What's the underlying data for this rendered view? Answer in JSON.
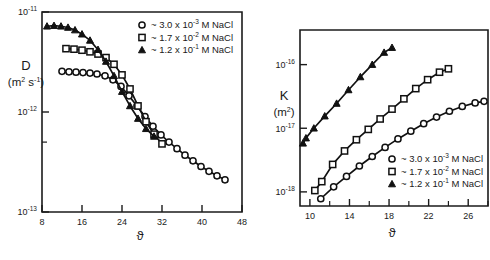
{
  "figure": {
    "panels": [
      "left-diffusion-panel",
      "right-permeability-panel"
    ]
  },
  "legend": {
    "entries": [
      {
        "marker": "open-circle",
        "label": "~ 3.0 x 10",
        "exponent": "-3",
        "unit": "M NaCl",
        "value": 3.0,
        "exp": -3
      },
      {
        "marker": "open-square",
        "label": "~ 1.7 x 10",
        "exponent": "-2",
        "unit": "M NaCl",
        "value": 1.7,
        "exp": -2
      },
      {
        "marker": "filled-triangle",
        "label": "~ 1.2 x 10",
        "exponent": "-1",
        "unit": "M NaCl",
        "value": 1.2,
        "exp": -1
      }
    ]
  },
  "chart_data": [
    {
      "id": "left-diffusion-panel",
      "type": "line",
      "title": "",
      "ylabel": "D",
      "ylabel_units": "(m2 s-1)",
      "ylabel_main": "D",
      "xlabel": "ϑ",
      "xlim": [
        8,
        48
      ],
      "ylim": [
        1e-13,
        1e-11
      ],
      "yscale": "log",
      "grid": false,
      "legend_position": "top-right",
      "xticks": [
        8,
        16,
        24,
        32,
        40,
        48
      ],
      "xticklabels": [
        "8",
        "16",
        "24",
        "32",
        "40",
        "48"
      ],
      "yticks": [
        1e-13,
        1e-12,
        1e-11
      ],
      "yticklabels": [
        "10-13",
        "10-12",
        "10-11"
      ],
      "yticklabels_base": [
        "10",
        "10",
        "10"
      ],
      "yticklabels_exp": [
        "-13",
        "-12",
        "-11"
      ],
      "yminorticks": [
        5e-13
      ],
      "series": [
        {
          "name": "~ 3.0 x 10-3 M NaCl",
          "marker": "open-circle",
          "x": [
            12.0,
            13.4,
            14.8,
            16.2,
            17.6,
            19.0,
            20.6,
            22.2,
            23.8,
            25.4,
            27.0,
            28.6,
            30.2,
            31.8,
            33.4,
            35.0,
            36.6,
            38.2,
            39.8,
            41.4,
            43.0,
            44.6
          ],
          "y": [
            2.55e-12,
            2.52e-12,
            2.5e-12,
            2.48e-12,
            2.45e-12,
            2.4e-12,
            2.3e-12,
            2.1e-12,
            1.8e-12,
            1.45e-12,
            1.15e-12,
            9e-13,
            7.2e-13,
            5.9e-13,
            5e-13,
            4.3e-13,
            3.7e-13,
            3.25e-13,
            2.85e-13,
            2.55e-13,
            2.3e-13,
            2.1e-13
          ]
        },
        {
          "name": "~ 1.7 x 10-2 M NaCl",
          "marker": "open-square",
          "x": [
            12.8,
            14.4,
            16.0,
            17.6,
            19.2,
            20.8,
            22.4,
            24.0,
            25.6,
            27.2,
            28.8,
            30.4,
            32.0
          ],
          "y": [
            4.3e-12,
            4.25e-12,
            4.15e-12,
            4e-12,
            3.8e-12,
            3.5e-12,
            3e-12,
            2.35e-12,
            1.7e-12,
            1.15e-12,
            8e-13,
            6e-13,
            4.8e-13
          ]
        },
        {
          "name": "~ 1.2 x 10-1 M NaCl",
          "marker": "filled-triangle",
          "x": [
            9.0,
            10.4,
            11.8,
            13.2,
            14.6,
            16.0,
            17.6,
            19.2,
            20.8,
            22.4,
            24.0,
            25.6,
            27.2,
            28.8,
            30.4
          ],
          "y": [
            7.2e-12,
            7.3e-12,
            7.2e-12,
            7e-12,
            6.6e-12,
            6e-12,
            5.2e-12,
            4.2e-12,
            3.2e-12,
            2.3e-12,
            1.6e-12,
            1.15e-12,
            8.6e-13,
            6.8e-13,
            5.7e-13
          ]
        }
      ]
    },
    {
      "id": "right-permeability-panel",
      "type": "line",
      "title": "",
      "ylabel": "K",
      "ylabel_units": "(m2)",
      "ylabel_main": "K",
      "xlabel": "ϑ",
      "xlim": [
        9,
        28
      ],
      "ylim": [
        6e-19,
        3.5e-16
      ],
      "yscale": "log",
      "grid": false,
      "legend_position": "bottom-right",
      "xticks": [
        10,
        14,
        18,
        22,
        26
      ],
      "xticklabels": [
        "10",
        "14",
        "18",
        "22",
        "26"
      ],
      "xminorticks": [
        12,
        16,
        20,
        24,
        28
      ],
      "yticks": [
        1e-18,
        1e-17,
        1e-16
      ],
      "yticklabels": [
        "10-18",
        "10-17",
        "10-16"
      ],
      "yticklabels_base": [
        "10",
        "10",
        "10"
      ],
      "yticklabels_exp": [
        "-18",
        "-17",
        "-16"
      ],
      "series": [
        {
          "name": "~ 3.0 x 10-3 M NaCl",
          "marker": "open-circle",
          "x": [
            11.1,
            12.4,
            13.7,
            15.0,
            16.3,
            17.6,
            18.9,
            20.2,
            21.5,
            22.8,
            24.1,
            25.4,
            26.7,
            27.6
          ],
          "y": [
            7.8e-19,
            1.2e-18,
            1.75e-18,
            2.55e-18,
            3.6e-18,
            5e-18,
            6.8e-18,
            9e-18,
            1.18e-17,
            1.5e-17,
            1.85e-17,
            2.2e-17,
            2.5e-17,
            2.65e-17
          ]
        },
        {
          "name": "~ 1.7 x 10-2 M NaCl",
          "marker": "open-square",
          "x": [
            10.5,
            11.2,
            12.3,
            13.5,
            14.7,
            15.9,
            17.1,
            18.3,
            19.5,
            20.7,
            21.9,
            23.1,
            24.0
          ],
          "y": [
            1.05e-18,
            1.45e-18,
            2.7e-18,
            4.4e-18,
            6.6e-18,
            9.6e-18,
            1.4e-17,
            2e-17,
            2.9e-17,
            4.2e-17,
            5.8e-17,
            7.6e-17,
            8.6e-17
          ]
        },
        {
          "name": "~ 1.2 x 10-1 M NaCl",
          "marker": "filled-triangle",
          "x": [
            9.3,
            9.6,
            10.4,
            11.5,
            12.7,
            13.9,
            15.1,
            16.3,
            17.5,
            18.3
          ],
          "y": [
            5.8e-18,
            7e-18,
            1e-17,
            1.55e-17,
            2.45e-17,
            4e-17,
            6.4e-17,
            1e-16,
            1.55e-16,
            1.85e-16
          ]
        }
      ]
    }
  ],
  "colors": {
    "ink": "#1a1a1a",
    "marker_fill": "#ffffff",
    "marker_stroke": "#111111",
    "background": "#ffffff"
  }
}
